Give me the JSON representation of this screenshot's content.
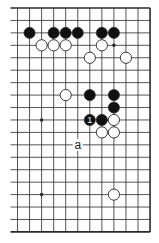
{
  "diagram": {
    "type": "go-board-fragment",
    "visible_columns": 12,
    "visible_rows": 19,
    "edges": {
      "top": true,
      "right": true,
      "bottom": true,
      "left": false
    },
    "colors": {
      "line": "#2a2a2a",
      "black_stone": "#111111",
      "white_stone": "#ffffff",
      "stone_outline": "#222222",
      "background": "#ffffff"
    },
    "star_points": [
      {
        "col": 8,
        "row": 3
      },
      {
        "col": 2,
        "row": 9
      },
      {
        "col": 2,
        "row": 15
      }
    ],
    "stones": [
      {
        "color": "black",
        "col": 1,
        "row": 2
      },
      {
        "color": "black",
        "col": 3,
        "row": 2
      },
      {
        "color": "black",
        "col": 4,
        "row": 2
      },
      {
        "color": "black",
        "col": 5,
        "row": 2
      },
      {
        "color": "black",
        "col": 7,
        "row": 2
      },
      {
        "color": "black",
        "col": 8,
        "row": 2
      },
      {
        "color": "white",
        "col": 2,
        "row": 3
      },
      {
        "color": "white",
        "col": 3,
        "row": 3
      },
      {
        "color": "white",
        "col": 4,
        "row": 3
      },
      {
        "color": "white",
        "col": 7,
        "row": 3
      },
      {
        "color": "white",
        "col": 6,
        "row": 4
      },
      {
        "color": "white",
        "col": 9,
        "row": 4
      },
      {
        "color": "white",
        "col": 4,
        "row": 7
      },
      {
        "color": "black",
        "col": 6,
        "row": 7
      },
      {
        "color": "black",
        "col": 8,
        "row": 7
      },
      {
        "color": "black",
        "col": 8,
        "row": 8
      },
      {
        "color": "black",
        "col": 6,
        "row": 9,
        "label": "1"
      },
      {
        "color": "black",
        "col": 7,
        "row": 9
      },
      {
        "color": "white",
        "col": 8,
        "row": 9
      },
      {
        "color": "white",
        "col": 7,
        "row": 10
      },
      {
        "color": "white",
        "col": 8,
        "row": 10
      },
      {
        "color": "white",
        "col": 8,
        "row": 15
      }
    ],
    "point_labels": [
      {
        "text": "a",
        "col": 5,
        "row": 11
      }
    ]
  }
}
